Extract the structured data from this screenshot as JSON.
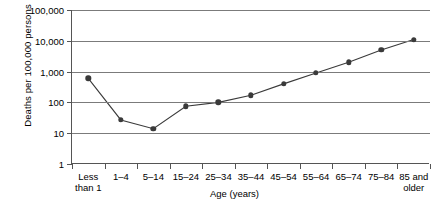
{
  "chart_data": {
    "type": "line",
    "title": "",
    "xlabel": "Age (years)",
    "ylabel": "Deaths per 100,000 persons",
    "categories": [
      "Less than 1",
      "1–4",
      "5–14",
      "15–24",
      "25–34",
      "35–44",
      "45–54",
      "55–64",
      "65–74",
      "75–84",
      "85 and older"
    ],
    "category_lines": [
      [
        "Less",
        "than 1"
      ],
      [
        "1–4"
      ],
      [
        "5–14"
      ],
      [
        "15–24"
      ],
      [
        "25–34"
      ],
      [
        "35–44"
      ],
      [
        "45–54"
      ],
      [
        "55–64"
      ],
      [
        "65–74"
      ],
      [
        "75–84"
      ],
      [
        "85 and",
        "older"
      ]
    ],
    "values": [
      600,
      27,
      14,
      75,
      100,
      170,
      400,
      900,
      2000,
      5000,
      11000
    ],
    "yscale": "log",
    "ylim": [
      1,
      100000
    ],
    "yticks": [
      1,
      10,
      100,
      1000,
      10000,
      100000
    ],
    "ytick_labels": [
      "1",
      "10",
      "100",
      "1,000",
      "10,000",
      "100,000"
    ],
    "grid": true,
    "legend": "none",
    "marker": "filled-circle",
    "line_color": "#3a3a3a",
    "marker_color": "#3a3a3a",
    "grid_color": "#7b7b7b",
    "axis_color": "#555555",
    "background": "#ffffff"
  }
}
